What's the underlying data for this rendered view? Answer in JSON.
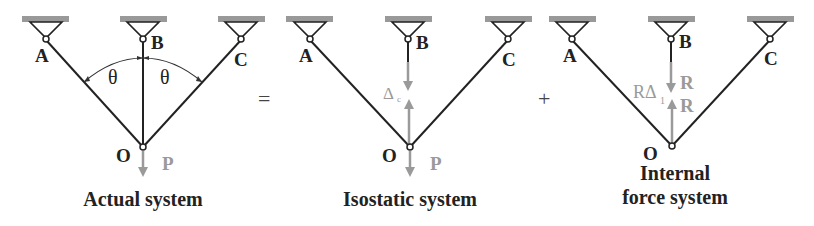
{
  "colors": {
    "member": "#222222",
    "support": "#999999",
    "force": "#9a9a9a"
  },
  "diagrams": [
    {
      "caption": [
        "Actual system"
      ],
      "nodes": {
        "A": "A",
        "B": "B",
        "C": "C",
        "O": "O"
      },
      "angle_label": "θ",
      "load_label": "P"
    },
    {
      "caption": [
        "Isostatic system"
      ],
      "nodes": {
        "A": "A",
        "B": "B",
        "C": "C",
        "O": "O"
      },
      "gap_label": "Δ",
      "gap_sub": "c",
      "load_label": "P"
    },
    {
      "caption": [
        "Internal",
        "force system"
      ],
      "nodes": {
        "A": "A",
        "B": "B",
        "C": "C",
        "O": "O"
      },
      "gap_label": "RΔ",
      "gap_sub": "1",
      "force_top": "R",
      "force_bottom": "R"
    }
  ],
  "operators": {
    "equals": "=",
    "plus": "+"
  }
}
